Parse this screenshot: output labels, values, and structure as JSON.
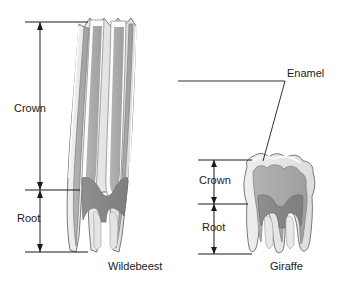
{
  "figure": {
    "background_color": "#ffffff",
    "line_color": "#1a1a1a"
  },
  "labels": {
    "crown_wildebeest": "Crown",
    "root_wildebeest": "Root",
    "crown_giraffe": "Crown",
    "root_giraffe": "Root",
    "enamel": "Enamel",
    "wildebeest": "Wildebeest",
    "giraffe": "Giraffe"
  },
  "specimens": [
    {
      "name": "Wildebeest",
      "tooth_type": "hypsodont",
      "crown_label": "Crown",
      "root_label": "Root",
      "crown_extent_px": [
        22,
        190
      ],
      "root_extent_px": [
        190,
        252
      ]
    },
    {
      "name": "Giraffe",
      "tooth_type": "brachydont",
      "crown_label": "Crown",
      "root_label": "Root",
      "crown_extent_px": [
        160,
        204
      ],
      "root_extent_px": [
        204,
        254
      ]
    }
  ],
  "callouts": [
    {
      "label": "Enamel",
      "targets": [
        "wildebeest-enamel-ridge",
        "giraffe-enamel-cap"
      ]
    }
  ],
  "tissue_colors": {
    "enamel": "#e8e8e8",
    "dentine": "#a8a8a8",
    "pulp_cement": "#8a8a8a",
    "cementum_light": "#d6d6d6",
    "outline": "#555555"
  }
}
